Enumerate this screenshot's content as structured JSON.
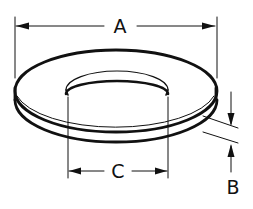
{
  "diagram": {
    "labels": {
      "outer_diameter": "A",
      "thickness": "B",
      "inner_diameter": "C"
    },
    "colors": {
      "line": "#111111",
      "background": "#ffffff"
    }
  }
}
